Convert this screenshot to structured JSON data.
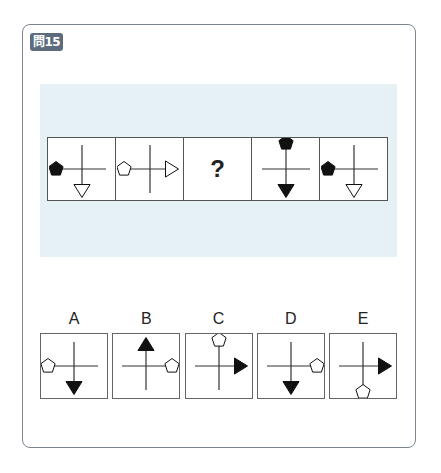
{
  "question": {
    "badge": "問15"
  },
  "sequence": [
    {
      "id": "s1",
      "kind": "figure",
      "pentagon": {
        "pos": "left",
        "fill": "black"
      },
      "triangle": {
        "pos": "down",
        "fill": "white"
      }
    },
    {
      "id": "s2",
      "kind": "figure",
      "pentagon": {
        "pos": "left",
        "fill": "white"
      },
      "triangle": {
        "pos": "right",
        "fill": "white"
      }
    },
    {
      "id": "s3",
      "kind": "question",
      "text": "?"
    },
    {
      "id": "s4",
      "kind": "figure",
      "pentagon": {
        "pos": "up",
        "fill": "black"
      },
      "triangle": {
        "pos": "down",
        "fill": "black"
      }
    },
    {
      "id": "s5",
      "kind": "figure",
      "pentagon": {
        "pos": "left",
        "fill": "black"
      },
      "triangle": {
        "pos": "down",
        "fill": "white"
      }
    }
  ],
  "options": [
    {
      "label": "A",
      "pentagon": {
        "pos": "left",
        "fill": "white"
      },
      "triangle": {
        "pos": "down",
        "fill": "black"
      }
    },
    {
      "label": "B",
      "pentagon": {
        "pos": "right",
        "fill": "white"
      },
      "triangle": {
        "pos": "up",
        "fill": "black"
      }
    },
    {
      "label": "C",
      "pentagon": {
        "pos": "up",
        "fill": "white"
      },
      "triangle": {
        "pos": "right",
        "fill": "black"
      }
    },
    {
      "label": "D",
      "pentagon": {
        "pos": "right",
        "fill": "white"
      },
      "triangle": {
        "pos": "down",
        "fill": "black"
      }
    },
    {
      "label": "E",
      "pentagon": {
        "pos": "down",
        "fill": "white"
      },
      "triangle": {
        "pos": "right",
        "fill": "black"
      }
    }
  ],
  "colors": {
    "frame": "#7d8590",
    "badge": "#5c6b7e",
    "band": "#e6f1f5"
  }
}
